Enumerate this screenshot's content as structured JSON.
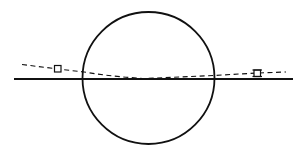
{
  "diagram": {
    "title": "",
    "colors": {
      "stroke": "#111111",
      "background": "#ffffff",
      "marker_fill": "#ffffff"
    },
    "elements": {
      "circle": {
        "label": ""
      },
      "horizontal_line": {
        "label": ""
      },
      "dashed_path": {
        "label": ""
      },
      "markers": [
        {
          "name": "left-marker",
          "shape": "square",
          "label": ""
        },
        {
          "name": "right-marker",
          "shape": "square-with-serifs",
          "label": ""
        }
      ]
    }
  }
}
